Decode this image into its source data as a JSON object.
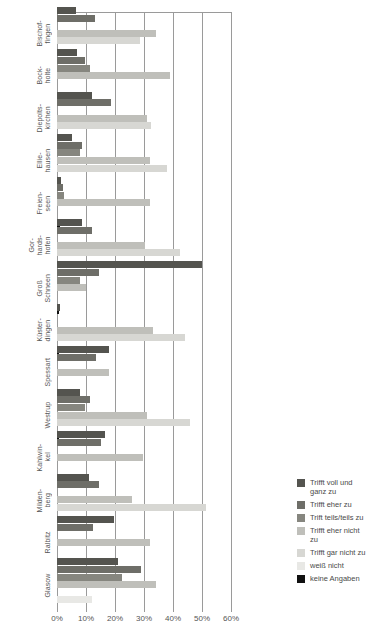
{
  "chart_data": {
    "type": "bar",
    "orientation": "horizontal",
    "title": "",
    "xlabel": "",
    "ylabel": "",
    "xlim": [
      60,
      0
    ],
    "x_axis_reversed": true,
    "grid": true,
    "legend_position": "right-bottom",
    "xticks": [
      "60%",
      "50%",
      "40%",
      "30%",
      "20%",
      "10%",
      "0%"
    ],
    "xtick_values": [
      60,
      50,
      40,
      30,
      20,
      10,
      0
    ],
    "categories": [
      "Bischof-\nfingen",
      "Bock-\nholte",
      "Diepolts-\nkirchen",
      "Ellie-\nhausen",
      "Freien-\nseen",
      "Gor-\nhards-\nhofen",
      "Groß\nSchneen",
      "Küster-\ndingen",
      "Spessart",
      "Westrup",
      "Kahlwin-\nkel",
      "Milden-\nberg",
      "Ralbitz",
      "Glasow"
    ],
    "series": [
      {
        "name": "Trifft voll und ganz zu",
        "color": "#54544f",
        "values": [
          53.5,
          53.0,
          48.0,
          55.0,
          58.5,
          51.5,
          10.0,
          59.0,
          42.0,
          52.0,
          43.5,
          49.0,
          40.5,
          39.0
        ]
      },
      {
        "name": "Trifft eher zu",
        "color": "#6e6e68",
        "values": [
          47.0,
          50.5,
          41.5,
          51.5,
          58.0,
          48.0,
          45.5,
          60.0,
          46.5,
          48.5,
          45.0,
          45.5,
          47.5,
          31.0
        ]
      },
      {
        "name": "Trift teils/teils zu",
        "color": "#86867f",
        "values": [
          60.0,
          48.5,
          60.0,
          52.0,
          57.5,
          60.0,
          52.0,
          60.0,
          60.0,
          50.5,
          60.0,
          60.0,
          60.0,
          37.5
        ]
      },
      {
        "name": "Trifft eher nicht zu",
        "color": "#bfbfba",
        "values": [
          26.0,
          21.0,
          29.0,
          28.0,
          28.0,
          29.5,
          50.0,
          27.0,
          42.0,
          29.0,
          30.5,
          34.0,
          28.0,
          26.0
        ]
      },
      {
        "name": "Trifft gar nicht zu",
        "color": "#d7d7d3",
        "values": [
          31.5,
          60.0,
          27.5,
          22.0,
          60.0,
          17.5,
          60.0,
          16.0,
          60.0,
          14.0,
          60.0,
          8.5,
          60.0,
          60.0
        ]
      },
      {
        "name": "weiß nicht",
        "color": "#e8e8e5",
        "values": [
          60.0,
          60.0,
          60.0,
          60.0,
          60.0,
          60.0,
          60.0,
          60.0,
          60.0,
          60.0,
          60.0,
          60.0,
          60.0,
          48.0
        ]
      },
      {
        "name": "keine Angaben",
        "color": "#111111",
        "values": [
          60.0,
          60.0,
          60.0,
          60.0,
          59.0,
          60.0,
          59.2,
          59.2,
          59.2,
          59.2,
          60.0,
          60.0,
          60.0,
          60.0
        ]
      }
    ]
  },
  "legend": {
    "items": [
      {
        "label": "Trifft voll und\nganz zu",
        "color": "#54544f"
      },
      {
        "label": "Trifft eher zu",
        "color": "#6e6e68"
      },
      {
        "label": "Trift teils/teils zu",
        "color": "#86867f"
      },
      {
        "label": "Trifft eher nicht\nzu",
        "color": "#bfbfba"
      },
      {
        "label": "Trifft gar nicht zu",
        "color": "#d7d7d3"
      },
      {
        "label": "weiß nicht",
        "color": "#e8e8e5"
      },
      {
        "label": "keine Angaben",
        "color": "#111111"
      }
    ]
  },
  "axis": {
    "gridline_color": "#9a9a9a",
    "tick_labels": [
      "60%",
      "50%",
      "40%",
      "30%",
      "20%",
      "10%",
      "0%"
    ]
  }
}
